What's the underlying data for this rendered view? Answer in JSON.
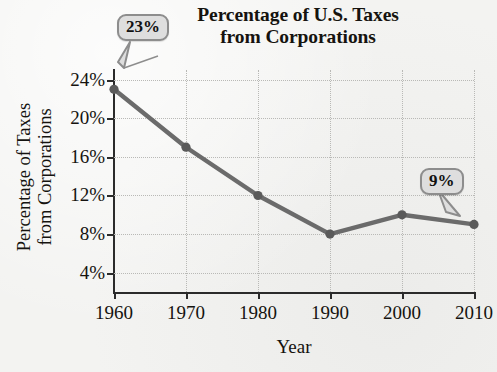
{
  "chart_data": {
    "type": "line",
    "title": "Percentage of U.S. Taxes from Corporations",
    "title_lines": [
      "Percentage of U.S. Taxes",
      "from Corporations"
    ],
    "xlabel": "Year",
    "ylabel": "Percentage of Taxes from Corporations",
    "ylabel_lines": [
      "Percentage of Taxes",
      "from Corporations"
    ],
    "x": [
      1960,
      1970,
      1980,
      1990,
      2000,
      2010
    ],
    "categories": [
      "1960",
      "1970",
      "1980",
      "1990",
      "2000",
      "2010"
    ],
    "values": [
      23,
      17,
      12,
      8,
      10,
      9
    ],
    "xtick_labels": [
      "1960",
      "1970",
      "1980",
      "1990",
      "2000",
      "2010"
    ],
    "ytick_labels": [
      "24%",
      "20%",
      "16%",
      "12%",
      "8%",
      "4%"
    ],
    "ytick_values": [
      24,
      20,
      16,
      12,
      8,
      4
    ],
    "xlim": [
      1960,
      2010
    ],
    "ylim": [
      2,
      25
    ],
    "grid": true,
    "legend": false,
    "series_color": "#6b6b6b",
    "marker_color": "#5a5a5a",
    "grid_color": "#b9b9b6",
    "axis_color": "#2b2b2b",
    "background_color": "#f3f3f1",
    "annotations": [
      {
        "label": "23%",
        "x": 1960,
        "y": 23
      },
      {
        "label": "9%",
        "x": 2010,
        "y": 9
      }
    ]
  },
  "callouts": {
    "first": "23%",
    "last": "9%"
  }
}
